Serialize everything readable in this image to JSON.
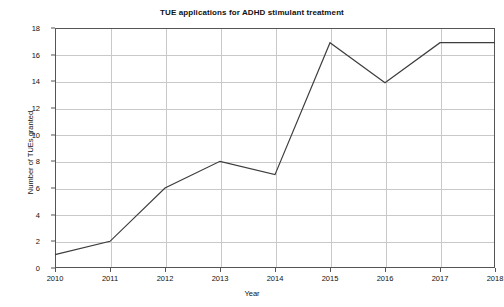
{
  "chart_data": {
    "type": "line",
    "title": "TUE applications for ADHD stimulant treatment",
    "xlabel": "Year",
    "ylabel": "Number of TUEs granted",
    "categories": [
      "2010",
      "2011",
      "2012",
      "2013",
      "2014",
      "2015",
      "2016",
      "2017",
      "2018"
    ],
    "x": [
      2010,
      2011,
      2012,
      2013,
      2014,
      2015,
      2016,
      2017,
      2018
    ],
    "values": [
      1,
      2,
      6,
      8,
      7,
      16.9,
      13.9,
      16.9,
      16.9
    ],
    "series": [
      {
        "name": "TUEs granted",
        "values": [
          1,
          2,
          6,
          8,
          7,
          16.9,
          13.9,
          16.9,
          16.9
        ]
      }
    ],
    "xlim": [
      2010,
      2018
    ],
    "ylim": [
      0,
      18
    ],
    "yticks": [
      0,
      2,
      4,
      6,
      8,
      10,
      12,
      14,
      16,
      18
    ],
    "ytick_labels": [
      "0",
      "2",
      "4",
      "6",
      "8",
      "10",
      "12",
      "14",
      "16",
      "18"
    ],
    "xticks": [
      2010,
      2011,
      2012,
      2013,
      2014,
      2015,
      2016,
      2017,
      2018
    ],
    "xtick_labels": [
      "2010",
      "2011",
      "2012",
      "2013",
      "2014",
      "2015",
      "2016",
      "2017",
      "2018"
    ],
    "grid": true,
    "grid_axes": "both",
    "legend": false,
    "legend_position": "none",
    "markers": false,
    "line_color": "#3d3d3d",
    "grid_color": "#c9c9c9",
    "frame_color": "#555555",
    "background_color": "#ffffff",
    "text_color": "#111111"
  }
}
